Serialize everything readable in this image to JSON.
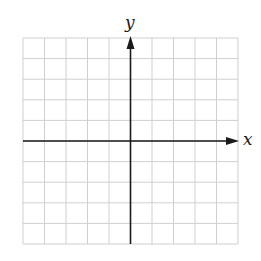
{
  "diagram": {
    "type": "coordinate-grid",
    "grid": {
      "columns": 10,
      "rows": 10,
      "origin_column": 5,
      "origin_row": 5,
      "line_color": "#cfcfcf",
      "axis_color": "#1a1a1a"
    },
    "x_axis": {
      "label": "x",
      "arrow": "right"
    },
    "y_axis": {
      "label": "y",
      "arrow": "up"
    }
  }
}
